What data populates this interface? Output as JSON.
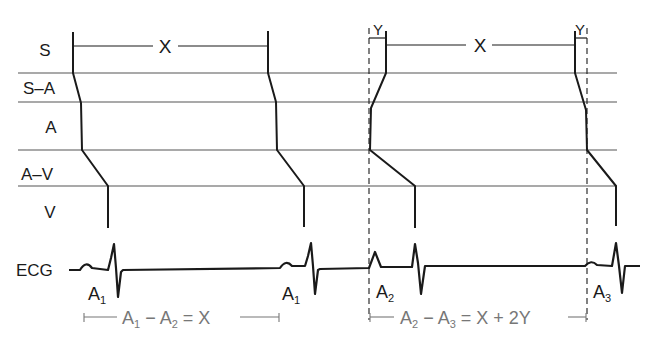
{
  "diagram": {
    "rows": [
      {
        "id": "S",
        "label": "S"
      },
      {
        "id": "S-A",
        "label": "S–A"
      },
      {
        "id": "A",
        "label": "A"
      },
      {
        "id": "A-V",
        "label": "A–V"
      },
      {
        "id": "V",
        "label": "V"
      },
      {
        "id": "ECG",
        "label": "ECG"
      }
    ],
    "intervals": {
      "x_left": "X",
      "x_right": "X",
      "y_left": "Y",
      "y_right": "Y"
    },
    "beats": [
      {
        "label": "A",
        "sub": "1"
      },
      {
        "label": "A",
        "sub": "1"
      },
      {
        "label": "A",
        "sub": "2"
      },
      {
        "label": "A",
        "sub": "3"
      }
    ],
    "equations": {
      "left": {
        "a": "A",
        "a_sub": "1",
        "minus": " − ",
        "b": "A",
        "b_sub": "2",
        "rest": " = X"
      },
      "right": {
        "a": "A",
        "a_sub": "2",
        "minus": " − ",
        "b": "A",
        "b_sub": "3",
        "rest": " = X + 2Y"
      }
    },
    "colors": {
      "line": "#1a1a1a",
      "grid": "#555555",
      "annotation": "#777777"
    }
  }
}
